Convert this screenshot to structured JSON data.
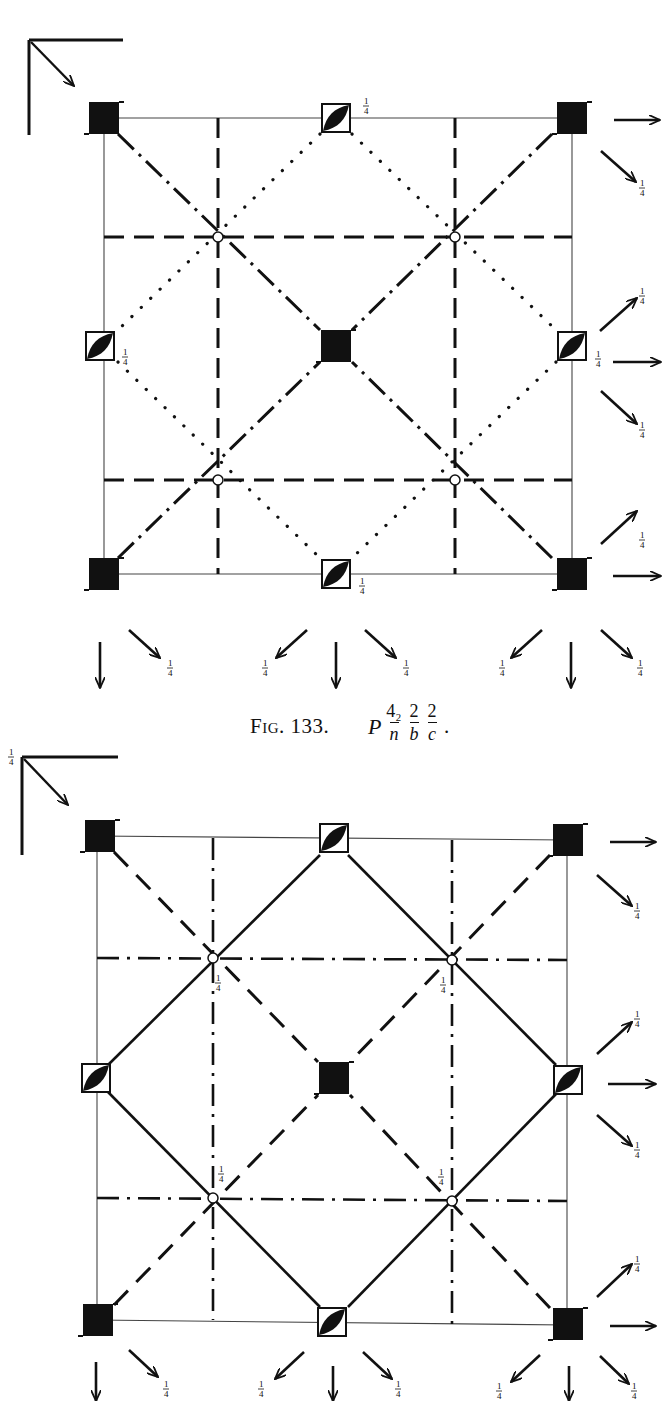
{
  "figures": [
    {
      "id": "fig133",
      "caption": {
        "label": "Fig. 133.",
        "symbol": {
          "lattice": "P",
          "parts": [
            {
              "num": "4₂",
              "den": "n"
            },
            {
              "num": "2",
              "den": "b"
            },
            {
              "num": "2",
              "den": "c"
            }
          ],
          "trailing": "."
        }
      },
      "height_label": "¼",
      "symmetry_elements": {
        "fourfold_screw_axes": [
          "corners",
          "center"
        ],
        "twofold_axes_with_rotoinversion": [
          "edge-midpoints"
        ],
        "inversion_centers": 4,
        "glide_planes": [
          "dotted diagonals",
          "dash-dot diagonals",
          "dashed axial"
        ]
      }
    },
    {
      "id": "fig134",
      "corner_label": "¼",
      "height_label": "¼",
      "symmetry_elements": {
        "fourfold_screw_axes": [
          "corners",
          "center"
        ],
        "twofold_axes_with_rotoinversion": [
          "edge-midpoints"
        ],
        "inversion_centers": 4,
        "glide_planes": [
          "solid diagonals",
          "dashed diagonals",
          "dash-dot axial"
        ]
      }
    }
  ],
  "labels": {
    "quarter": "¼"
  }
}
